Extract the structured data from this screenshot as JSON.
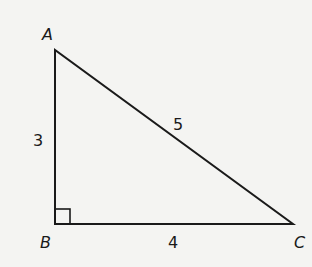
{
  "diagram": {
    "type": "right-triangle",
    "vertices": {
      "A": {
        "label": "A"
      },
      "B": {
        "label": "B"
      },
      "C": {
        "label": "C"
      }
    },
    "sides": {
      "AB": {
        "label": "3"
      },
      "BC": {
        "label": "4"
      },
      "AC": {
        "label": "5"
      }
    },
    "right_angle_at": "B",
    "colors": {
      "stroke": "#1a1a1a",
      "background": "#f4f4f2"
    }
  }
}
